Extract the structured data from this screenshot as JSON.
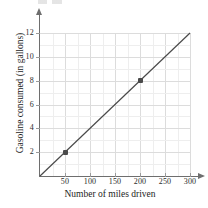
{
  "chart_data": {
    "type": "line",
    "title": "",
    "xlabel": "Number of miles driven",
    "ylabel": "Gasoline consumed (in gallons)",
    "xlim": [
      0,
      300
    ],
    "ylim": [
      0,
      12
    ],
    "grid": true,
    "legend": "none",
    "x_ticks": [
      50,
      100,
      150,
      200,
      250,
      300
    ],
    "x_tick_labels": [
      "50",
      "100",
      "150",
      "200",
      "250",
      "300"
    ],
    "y_ticks": [
      2,
      4,
      6,
      8,
      10,
      12
    ],
    "y_tick_labels": [
      "2",
      "4",
      "6",
      "8",
      "10",
      "12"
    ],
    "x_minor_step": 25,
    "y_minor_step": 1,
    "series": [
      {
        "name": "Gasoline consumption",
        "line_color": "#4a4a4a",
        "x": [
          0,
          300
        ],
        "y": [
          0,
          12
        ],
        "slope_gallons_per_mile": 0.04,
        "intercept": 0
      }
    ],
    "points": [
      {
        "label": "(50, 2)",
        "x": 50,
        "y": 2
      },
      {
        "label": "(200, 8)",
        "x": 200,
        "y": 8
      }
    ]
  },
  "axes": {
    "y_axis_name": "gasoline-axis",
    "x_axis_name": "miles-axis"
  }
}
